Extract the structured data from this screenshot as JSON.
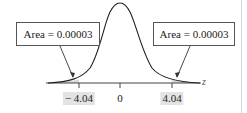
{
  "diagram": {
    "type": "normal-distribution-two-tailed",
    "axis_variable": "z",
    "ticks": [
      {
        "label": "− 4.04",
        "value": -4.04,
        "shaded": true
      },
      {
        "label": "0",
        "value": 0,
        "shaded": false
      },
      {
        "label": "4.04",
        "value": 4.04,
        "shaded": true
      }
    ],
    "callouts": [
      {
        "text": "Area = 0.00003",
        "side": "left"
      },
      {
        "text": "Area = 0.00003",
        "side": "right"
      }
    ],
    "colors": {
      "curve": "#222222",
      "tail_shade": "#d9d9d9",
      "label_shade": "#e3e3e3",
      "box_border": "#555555"
    }
  }
}
